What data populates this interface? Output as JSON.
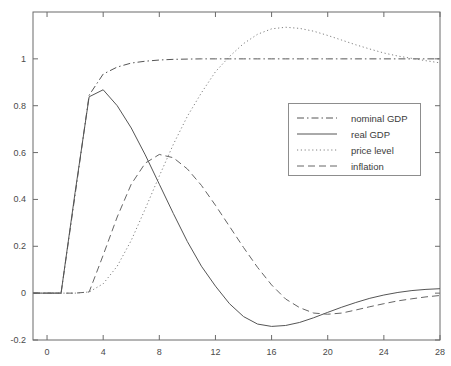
{
  "chart_data": {
    "type": "line",
    "title": "",
    "xlabel": "",
    "ylabel": "",
    "xlim": [
      -1,
      28
    ],
    "ylim": [
      -0.2,
      1.2
    ],
    "grid": false,
    "legend_position": "center-right",
    "xticks": [
      "0",
      "4",
      "8",
      "12",
      "16",
      "20",
      "24",
      "28"
    ],
    "xtick_values": [
      0,
      4,
      8,
      12,
      16,
      20,
      24,
      28
    ],
    "yticks": [
      "-0.2",
      "0",
      "0.2",
      "0.4",
      "0.6",
      "0.8",
      "1"
    ],
    "ytick_values": [
      -0.2,
      0,
      0.2,
      0.4,
      0.6,
      0.8,
      1
    ],
    "x": [
      -1,
      0,
      1,
      2,
      3,
      4,
      5,
      6,
      7,
      8,
      9,
      10,
      11,
      12,
      13,
      14,
      15,
      16,
      17,
      18,
      19,
      20,
      21,
      22,
      23,
      24,
      25,
      26,
      27,
      28
    ],
    "series": [
      {
        "name": "nominal GDP",
        "style": "dashdot",
        "color": "#555555",
        "values": [
          0,
          0,
          0,
          0.42,
          0.845,
          0.935,
          0.965,
          0.982,
          0.99,
          0.995,
          0.998,
          0.999,
          1.0,
          1.0,
          1.0,
          1.0,
          1.0,
          1.0,
          1.0,
          1.0,
          1.0,
          1.0,
          1.0,
          1.0,
          1.0,
          1.0,
          1.0,
          1.0,
          1.0,
          1.0
        ]
      },
      {
        "name": "real GDP",
        "style": "solid",
        "color": "#555555",
        "values": [
          0,
          0,
          0,
          0.43,
          0.838,
          0.868,
          0.8,
          0.705,
          0.59,
          0.465,
          0.34,
          0.22,
          0.115,
          0.03,
          -0.045,
          -0.1,
          -0.132,
          -0.142,
          -0.138,
          -0.125,
          -0.105,
          -0.082,
          -0.06,
          -0.04,
          -0.022,
          -0.008,
          0.003,
          0.011,
          0.016,
          0.019
        ]
      },
      {
        "name": "price level",
        "style": "dotted",
        "color": "#808080",
        "values": [
          0,
          0,
          0,
          0,
          0.005,
          0.04,
          0.115,
          0.225,
          0.36,
          0.5,
          0.635,
          0.755,
          0.855,
          0.945,
          1.01,
          1.065,
          1.105,
          1.128,
          1.135,
          1.13,
          1.118,
          1.1,
          1.08,
          1.06,
          1.042,
          1.025,
          1.012,
          1.002,
          0.992,
          0.983
        ]
      },
      {
        "name": "inflation",
        "style": "dashed",
        "color": "#666666",
        "values": [
          0,
          0,
          0,
          0,
          0.005,
          0.162,
          0.325,
          0.465,
          0.555,
          0.592,
          0.578,
          0.53,
          0.46,
          0.375,
          0.285,
          0.195,
          0.11,
          0.035,
          -0.025,
          -0.062,
          -0.085,
          -0.09,
          -0.085,
          -0.072,
          -0.058,
          -0.045,
          -0.033,
          -0.024,
          -0.016,
          -0.01
        ]
      }
    ]
  },
  "legend": {
    "items": [
      {
        "label": "nominal GDP",
        "style": "dashdot"
      },
      {
        "label": "real GDP",
        "style": "solid"
      },
      {
        "label": "price level",
        "style": "dotted"
      },
      {
        "label": "inflation",
        "style": "dashed"
      }
    ]
  },
  "colors": {
    "axis": "#6b6b6b",
    "text": "#4a4a4a",
    "legend_border": "#8d8d8d",
    "background": "#ffffff"
  }
}
